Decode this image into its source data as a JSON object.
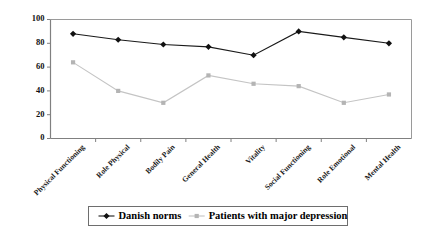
{
  "chart_data": {
    "type": "line",
    "title": "",
    "subtitle": "",
    "xlabel": "",
    "ylabel": "",
    "ylim": [
      0,
      100
    ],
    "yticks": [
      0,
      20,
      40,
      60,
      80,
      100
    ],
    "grid": false,
    "legend_position": "bottom",
    "categories": [
      "Physical Functioning",
      "Role Physical",
      "Bodily Pain",
      "General Health",
      "Vitality",
      "Social Functioning",
      "Role Emotional",
      "Mental Health"
    ],
    "series": [
      {
        "name": "Danish norms",
        "color": "#111111",
        "marker": "diamond",
        "values": [
          88,
          83,
          79,
          77,
          70,
          90,
          85,
          80
        ]
      },
      {
        "name": "Patients with major depression",
        "color": "#b4b4b4",
        "marker": "square",
        "values": [
          64,
          40,
          30,
          53,
          46,
          44,
          30,
          37
        ]
      }
    ]
  },
  "axes": {
    "y_tick_labels": [
      "100",
      "80",
      "60",
      "40",
      "20",
      "0"
    ]
  },
  "legend": {
    "items": [
      {
        "label": "Danish norms",
        "marker": "diamond",
        "color": "#111111"
      },
      {
        "label": "Patients with major depression",
        "marker": "square",
        "color": "#b4b4b4"
      }
    ]
  },
  "colors": {
    "axis": "#808080",
    "plot_border": "#9a9a9a",
    "norms_line": "#1a1a1a",
    "patients_line": "#c4c4c4",
    "legend_border": "#6e6e6e",
    "background": "#ffffff"
  }
}
